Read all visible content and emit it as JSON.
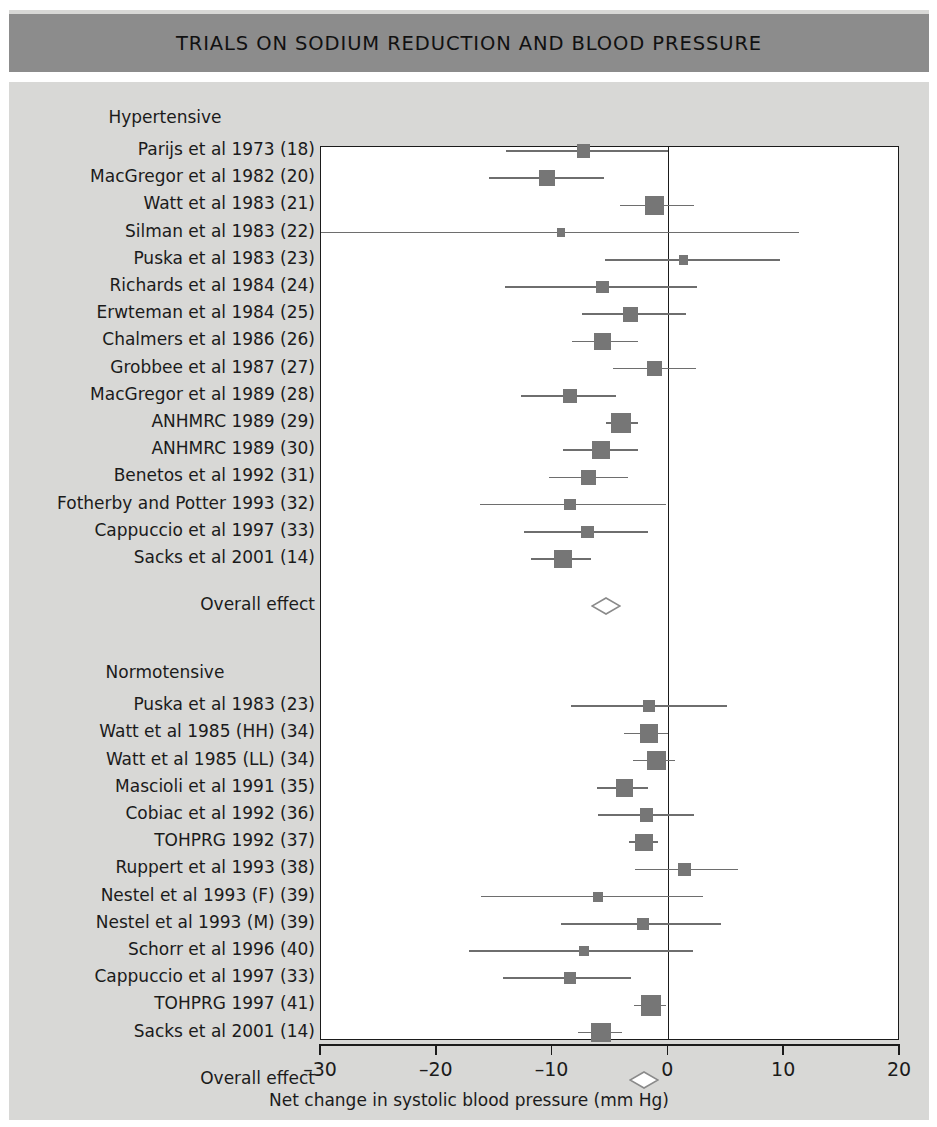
{
  "banner": {
    "title": "TRIALS ON SODIUM REDUCTION AND BLOOD PRESSURE"
  },
  "axis": {
    "title": "Net change in systolic blood pressure (mm Hg)",
    "ticks": [
      "–30",
      "–20",
      "–10",
      "0",
      "10",
      "20"
    ]
  },
  "groups": {
    "hypertensive_heading": "Hypertensive",
    "normotensive_heading": "Normotensive",
    "overall_label": "Overall effect"
  },
  "chart_data": {
    "type": "forest",
    "title": "TRIALS ON SODIUM REDUCTION AND BLOOD PRESSURE",
    "xlabel": "Net change in systolic blood pressure (mm Hg)",
    "ylabel": "",
    "xlim": [
      -30,
      20
    ],
    "xticks": [
      -30,
      -20,
      -10,
      0,
      10,
      20
    ],
    "grid": false,
    "reference_line": 0,
    "legend": "none",
    "groups": [
      {
        "name": "Hypertensive",
        "studies": [
          {
            "label": "Parijs et al 1973 (18)",
            "estimate": -7.3,
            "ci_low": -14.0,
            "ci_high": 0.0,
            "weight": 0.42
          },
          {
            "label": "MacGregor et al 1982 (20)",
            "estimate": -10.5,
            "ci_low": -15.5,
            "ci_high": -5.6,
            "weight": 0.6
          },
          {
            "label": "Watt et al 1983 (21)",
            "estimate": -1.2,
            "ci_low": -4.2,
            "ci_high": 2.2,
            "weight": 0.78
          },
          {
            "label": "Silman et al 1983 (22)",
            "estimate": -9.3,
            "ci_low": -30.0,
            "ci_high": 11.3,
            "weight": 0.13
          },
          {
            "label": "Puska et al 1983 (23)",
            "estimate": 1.3,
            "ci_low": -5.5,
            "ci_high": 9.6,
            "weight": 0.22
          },
          {
            "label": "Richards et al 1984 (24)",
            "estimate": -5.7,
            "ci_low": -14.1,
            "ci_high": 2.5,
            "weight": 0.4
          },
          {
            "label": "Erwteman et al 1984 (25)",
            "estimate": -3.3,
            "ci_low": -7.5,
            "ci_high": 1.5,
            "weight": 0.52
          },
          {
            "label": "Chalmers et al 1986 (26)",
            "estimate": -5.7,
            "ci_low": -8.3,
            "ci_high": -2.6,
            "weight": 0.64
          },
          {
            "label": "Grobbee et al 1987 (27)",
            "estimate": -1.2,
            "ci_low": -4.8,
            "ci_high": 2.4,
            "weight": 0.55
          },
          {
            "label": "MacGregor et al 1989 (28)",
            "estimate": -8.5,
            "ci_low": -12.7,
            "ci_high": -4.5,
            "weight": 0.5
          },
          {
            "label": "ANHMRC 1989 (29)",
            "estimate": -4.1,
            "ci_low": -5.4,
            "ci_high": -2.6,
            "weight": 0.8
          },
          {
            "label": "ANHMRC 1989 (30)",
            "estimate": -5.8,
            "ci_low": -9.1,
            "ci_high": -2.6,
            "weight": 0.68
          },
          {
            "label": "Benetos et al 1992 (31)",
            "estimate": -6.9,
            "ci_low": -10.3,
            "ci_high": -3.5,
            "weight": 0.52
          },
          {
            "label": "Fotherby and Potter 1993 (32)",
            "estimate": -8.5,
            "ci_low": -16.3,
            "ci_high": -0.2,
            "weight": 0.33
          },
          {
            "label": "Cappuccio et al 1997 (33)",
            "estimate": -7.0,
            "ci_low": -12.5,
            "ci_high": -1.8,
            "weight": 0.38
          },
          {
            "label": "Sacks et al 2001 (14)",
            "estimate": -9.1,
            "ci_low": -11.9,
            "ci_high": -6.7,
            "weight": 0.72
          }
        ],
        "overall": {
          "label": "Overall effect",
          "estimate": -5.4,
          "ci_low": -6.5,
          "ci_high": -4.1
        }
      },
      {
        "name": "Normotensive",
        "studies": [
          {
            "label": "Puska et al 1983 (23)",
            "estimate": -1.7,
            "ci_low": -8.4,
            "ci_high": 5.1,
            "weight": 0.35
          },
          {
            "label": "Watt et al 1985 (HH) (34)",
            "estimate": -1.7,
            "ci_low": -3.8,
            "ci_high": 0.0,
            "weight": 0.72
          },
          {
            "label": "Watt et al 1985 (LL) (34)",
            "estimate": -1.0,
            "ci_low": -3.1,
            "ci_high": 0.6,
            "weight": 0.75
          },
          {
            "label": "Mascioli et al 1991 (35)",
            "estimate": -3.8,
            "ci_low": -6.2,
            "ci_high": -1.8,
            "weight": 0.68
          },
          {
            "label": "Cobiac et al 1992 (36)",
            "estimate": -1.9,
            "ci_low": -6.1,
            "ci_high": 2.2,
            "weight": 0.42
          },
          {
            "label": "TOHPRG 1992 (37)",
            "estimate": -2.1,
            "ci_low": -3.4,
            "ci_high": -0.9,
            "weight": 0.66
          },
          {
            "label": "Ruppert et al 1993 (38)",
            "estimate": 1.4,
            "ci_low": -2.9,
            "ci_high": 6.0,
            "weight": 0.42
          },
          {
            "label": "Nestel et al 1993 (F) (39)",
            "estimate": -6.1,
            "ci_low": -16.2,
            "ci_high": 3.0,
            "weight": 0.23
          },
          {
            "label": "Nestel et al 1993 (M) (39)",
            "estimate": -2.2,
            "ci_low": -9.3,
            "ci_high": 4.5,
            "weight": 0.35
          },
          {
            "label": "Schorr et al 1996 (40)",
            "estimate": -7.3,
            "ci_low": -17.2,
            "ci_high": 2.1,
            "weight": 0.25
          },
          {
            "label": "Cappuccio et al 1997 (33)",
            "estimate": -8.5,
            "ci_low": -14.3,
            "ci_high": -3.2,
            "weight": 0.32
          },
          {
            "label": "TOHPRG 1997 (41)",
            "estimate": -1.5,
            "ci_low": -3.0,
            "ci_high": -0.2,
            "weight": 0.85
          },
          {
            "label": "Sacks et al 2001 (14)",
            "estimate": -5.8,
            "ci_low": -7.8,
            "ci_high": -4.0,
            "weight": 0.8
          }
        ],
        "overall": {
          "label": "Overall effect",
          "estimate": -2.1,
          "ci_low": -3.2,
          "ci_high": -1.0
        }
      }
    ]
  },
  "colors": {
    "banner": "#8c8c8c",
    "background": "#d8d8d6",
    "plot_bg": "#ffffff",
    "marker": "#767676",
    "line": "#6e6e6e",
    "axis": "#1b1b1b"
  }
}
